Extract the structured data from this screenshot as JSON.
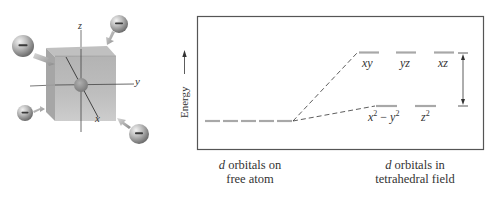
{
  "figure": {
    "left_panel": {
      "title": "tetrahedral field geometry",
      "axes": {
        "x_label": "x",
        "y_label": "y",
        "z_label": "z"
      },
      "charges": [
        {
          "position": "top-left",
          "symbol": "−"
        },
        {
          "position": "top-right",
          "symbol": "−"
        },
        {
          "position": "bottom-left",
          "symbol": "−"
        },
        {
          "position": "bottom-right",
          "symbol": "−"
        }
      ]
    },
    "right_panel": {
      "y_axis_label": "Energy",
      "free_atom": {
        "caption_d": "d",
        "caption_line1": " orbitals on",
        "caption_line2": "free atom",
        "orbital_count": 5
      },
      "tetrahedral_field": {
        "caption_d": "d",
        "caption_line1": " orbitals in",
        "caption_line2": "tetrahedral field",
        "upper_orbitals": [
          {
            "label": "xy"
          },
          {
            "label": "yz"
          },
          {
            "label": "xz"
          }
        ],
        "lower_orbitals": [
          {
            "label_base1": "x",
            "sup1": "2",
            "mid": " − ",
            "label_base2": "y",
            "sup2": "2"
          },
          {
            "label_base1": "z",
            "sup1": "2"
          }
        ],
        "splitting_label": "Δ"
      }
    },
    "colors": {
      "frame": "#555555",
      "level": "#a8a8a8",
      "dashed": "#333333",
      "cube_face": "#a9a9a9",
      "text": "#333333"
    }
  }
}
